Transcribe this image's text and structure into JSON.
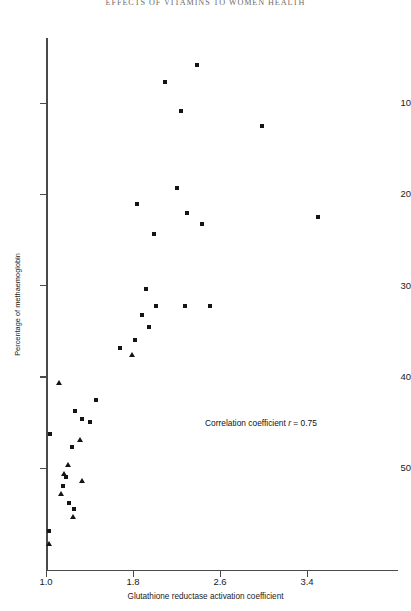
{
  "page_header": "EFFECTS OF VITAMINS TO WOMEN HEALTH",
  "axes": {
    "x_title": "Glutathione reductase activation coefficient",
    "y_title": "Percentage of methaemoglobin",
    "x_ticks": [
      "1.0",
      "1.8",
      "2.6",
      "3.4"
    ],
    "y_ticks": [
      "50",
      "40",
      "30",
      "20",
      "10"
    ]
  },
  "annotation": {
    "prefix": "Correlation coefficient ",
    "symbol": "r",
    "value": " = 0.75",
    "full": "Correlation coefficient r = 0.75"
  },
  "chart_data": {
    "type": "scatter",
    "title": "",
    "xlabel": "Glutathione reductase activation coefficient",
    "ylabel": "Percentage of methaemoglobin",
    "xlim": [
      1.0,
      4.0
    ],
    "ylim": [
      0,
      58
    ],
    "xticks": [
      1.0,
      1.8,
      2.6,
      3.4
    ],
    "yticks": [
      10,
      20,
      30,
      40,
      50
    ],
    "grid": false,
    "legend": null,
    "annotations": [
      {
        "text": "Correlation coefficient r = 0.75",
        "x": 2.46,
        "y": 17.5
      }
    ],
    "correlation_r": 0.75,
    "series": [
      {
        "name": "square-marker-group",
        "marker": "square",
        "color": "#141414",
        "points": [
          [
            2.39,
            54.2
          ],
          [
            2.09,
            52.3
          ],
          [
            2.24,
            49.1
          ],
          [
            2.99,
            47.5
          ],
          [
            2.2,
            40.7
          ],
          [
            1.84,
            38.9
          ],
          [
            2.3,
            38.0
          ],
          [
            3.5,
            37.5
          ],
          [
            2.43,
            36.7
          ],
          [
            1.99,
            35.6
          ],
          [
            1.92,
            29.6
          ],
          [
            2.01,
            27.8
          ],
          [
            2.28,
            27.7
          ],
          [
            2.51,
            27.8
          ],
          [
            1.88,
            26.8
          ],
          [
            1.95,
            25.5
          ],
          [
            1.82,
            24.0
          ],
          [
            1.68,
            23.1
          ],
          [
            1.46,
            17.5
          ],
          [
            1.27,
            16.2
          ],
          [
            1.33,
            15.4
          ],
          [
            1.4,
            15.0
          ],
          [
            1.04,
            13.7
          ],
          [
            1.24,
            12.3
          ],
          [
            1.18,
            9.0
          ],
          [
            1.16,
            8.0
          ],
          [
            1.21,
            6.2
          ],
          [
            1.26,
            5.5
          ],
          [
            1.03,
            3.1
          ]
        ]
      },
      {
        "name": "triangle-marker-group",
        "marker": "triangle",
        "color": "#141414",
        "points": [
          [
            1.79,
            22.4
          ],
          [
            1.12,
            19.3
          ],
          [
            1.31,
            13.1
          ],
          [
            1.2,
            10.3
          ],
          [
            1.17,
            9.3
          ],
          [
            1.33,
            8.6
          ],
          [
            1.14,
            7.1
          ],
          [
            1.25,
            4.6
          ],
          [
            1.03,
            1.7
          ]
        ]
      }
    ]
  }
}
